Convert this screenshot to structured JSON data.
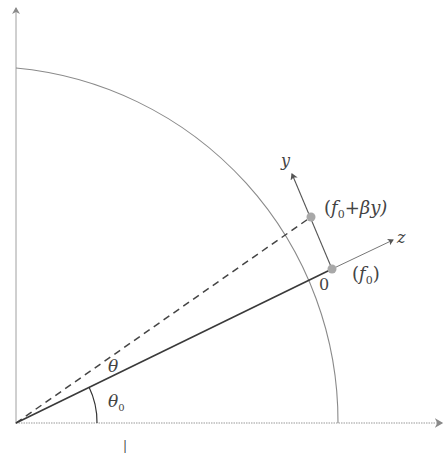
{
  "diagram": {
    "type": "geometry",
    "colors": {
      "axis": "#9a9a9a",
      "arc": "#8a8a8a",
      "main_line": "#3a3a3a",
      "point": "#a8a8a8",
      "text": "#444444"
    },
    "labels": {
      "y_axis": "y",
      "z_axis": "z",
      "origin_local": "0",
      "point_f0_open": "(",
      "point_f0_f": "f",
      "point_f0_sub": "0",
      "point_f0_close": ")",
      "point_shift_open": "(",
      "point_shift_f": "f",
      "point_shift_sub": "0",
      "point_shift_rest": "+βy)",
      "theta": "θ",
      "theta0": "θ",
      "theta0_sub": "0",
      "x_tick": "|"
    },
    "elements": [
      "horizontal axis (dotted, arrow right)",
      "vertical axis (arrow up)",
      "quarter circle arc",
      "solid radius line at angle θ0",
      "dashed radius line at angle θ0+θ",
      "local y axis tangent at f0",
      "local z axis radial at f0",
      "angle arc θ0"
    ]
  }
}
